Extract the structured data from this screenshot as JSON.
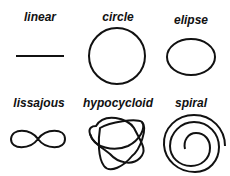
{
  "items": [
    {
      "label": "linear",
      "shape": "line-icon"
    },
    {
      "label": "circle",
      "shape": "circle-icon"
    },
    {
      "label": "elipse",
      "shape": "ellipse-icon"
    },
    {
      "label": "lissajous",
      "shape": "lissajous-icon"
    },
    {
      "label": "hypocycloid",
      "shape": "hypocycloid-icon"
    },
    {
      "label": "spiral",
      "shape": "spiral-icon"
    }
  ],
  "stroke_color": "#111111"
}
